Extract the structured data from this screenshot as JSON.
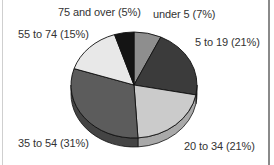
{
  "chart_data": {
    "type": "pie",
    "title": "",
    "style": "3d",
    "start_angle_deg": 0,
    "direction": "clockwise",
    "slices": [
      {
        "label": "under 5",
        "value": 7,
        "text": "under 5 (7%)",
        "color": "#8e8e8e",
        "side": "#6e6e6e"
      },
      {
        "label": "5 to 19",
        "value": 21,
        "text": "5 to 19 (21%)",
        "color": "#3b3b3b",
        "side": "#2a2a2a"
      },
      {
        "label": "20 to 34",
        "value": 21,
        "text": "20 to 34 (21%)",
        "color": "#cbcbcb",
        "side": "#a9a9a9"
      },
      {
        "label": "35 to 54",
        "value": 31,
        "text": "35 to 54 (31%)",
        "color": "#5c5c5c",
        "side": "#444444"
      },
      {
        "label": "55 to 74",
        "value": 15,
        "text": "55 to 74 (15%)",
        "color": "#e8e8e8",
        "side": "#c4c4c4"
      },
      {
        "label": "75 and over",
        "value": 5,
        "text": "75 and over (5%)",
        "color": "#141414",
        "side": "#0a0a0a"
      }
    ],
    "legend": "none (direct labels)"
  },
  "labels": {
    "under5": "under 5 (7%)",
    "5to19": "5 to 19 (21%)",
    "20to34": "20 to 34 (21%)",
    "35to54": "35 to 54 (31%)",
    "55to74": "55 to 74 (15%)",
    "75over": "75 and over (5%)"
  }
}
